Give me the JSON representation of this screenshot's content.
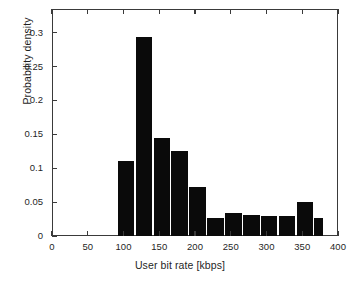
{
  "chart_data": {
    "type": "bar",
    "title": "",
    "xlabel": "User bit rate [kbps]",
    "ylabel": "Probability density",
    "xlim": [
      0,
      400
    ],
    "ylim": [
      0,
      0.335
    ],
    "grid": false,
    "legend": null,
    "bar_color": "#0a0a0a",
    "xticks": [
      0,
      50,
      100,
      150,
      200,
      250,
      300,
      350,
      400
    ],
    "xtick_labels": [
      "0",
      "50",
      "100",
      "150",
      "200",
      "250",
      "300",
      "350",
      "400"
    ],
    "yticks": [
      0,
      0.05,
      0.1,
      0.15,
      0.2,
      0.25,
      0.3
    ],
    "ytick_labels": [
      "0",
      "0.05",
      "0.1",
      "0.15",
      "0.2",
      "0.25",
      "0.3"
    ],
    "bin_edges": [
      92,
      117,
      142,
      167,
      192,
      217,
      242,
      267,
      292,
      317,
      342,
      367,
      381
    ],
    "bin_centers": [
      104.5,
      129.5,
      154.5,
      179.5,
      204.5,
      229.5,
      254.5,
      279.5,
      304.5,
      329.5,
      354.5,
      374
    ],
    "values": [
      0.111,
      0.293,
      0.144,
      0.126,
      0.073,
      0.026,
      0.034,
      0.031,
      0.029,
      0.03,
      0.05,
      0.027
    ],
    "bars": [
      {
        "x0": 92,
        "x1": 117,
        "value": 0.111
      },
      {
        "x0": 117,
        "x1": 142,
        "value": 0.293
      },
      {
        "x0": 142,
        "x1": 167,
        "value": 0.144
      },
      {
        "x0": 167,
        "x1": 192,
        "value": 0.126
      },
      {
        "x0": 192,
        "x1": 217,
        "value": 0.073
      },
      {
        "x0": 217,
        "x1": 242,
        "value": 0.026
      },
      {
        "x0": 242,
        "x1": 267,
        "value": 0.034
      },
      {
        "x0": 267,
        "x1": 292,
        "value": 0.031
      },
      {
        "x0": 292,
        "x1": 317,
        "value": 0.029
      },
      {
        "x0": 317,
        "x1": 342,
        "value": 0.03
      },
      {
        "x0": 342,
        "x1": 367,
        "value": 0.05
      },
      {
        "x0": 367,
        "x1": 381,
        "value": 0.027
      }
    ]
  }
}
